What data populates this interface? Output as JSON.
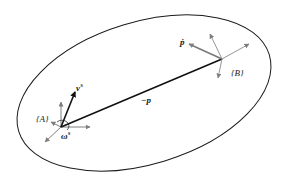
{
  "diagram": {
    "title": "",
    "colors": {
      "outline": "#1a1a1a",
      "frame_axes": "#8a8a8a",
      "vector": "#111111"
    },
    "body": {
      "shape": "ellipse",
      "cx": 144,
      "cy": 93,
      "rx": 132,
      "ry": 72,
      "rotation_deg": -17
    },
    "frames": [
      {
        "id": "A",
        "label": "{A}",
        "origin": [
          61,
          127
        ]
      },
      {
        "id": "B",
        "label": "{B}",
        "origin": [
          222,
          59
        ]
      }
    ],
    "vectors": [
      {
        "id": "neg_p",
        "label": "−p",
        "from": [
          61,
          127
        ],
        "to": [
          222,
          59
        ]
      },
      {
        "id": "v_s",
        "label": "v",
        "label_sup": "s",
        "from": [
          61,
          127
        ],
        "to": [
          75,
          92
        ]
      },
      {
        "id": "omega_s",
        "label": "ω",
        "label_sup": "s"
      },
      {
        "id": "p_dot",
        "label": "ṗ",
        "from": [
          222,
          59
        ],
        "to": [
          190,
          44
        ]
      }
    ]
  },
  "labels": {
    "frame_a": "{A}",
    "frame_b": "{B}",
    "neg_p": "−p",
    "v_s_base": "v",
    "v_s_sup": "s",
    "omega_s_base": "ω",
    "omega_s_sup": "s",
    "p_dot": "ṗ"
  }
}
